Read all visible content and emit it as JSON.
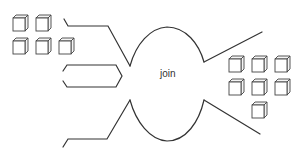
{
  "diagram": {
    "type": "join-illustration",
    "center_label": "join",
    "colors": {
      "stroke": "#333333",
      "background": "#ffffff"
    },
    "inputs": {
      "cube_group_left": {
        "rows": [
          2,
          3
        ],
        "count": 5
      },
      "streams": [
        "top-input-stream",
        "middle-input-stream",
        "bottom-input-stream"
      ]
    },
    "outputs": {
      "cube_group_right": {
        "rows": [
          3,
          3,
          1
        ],
        "count": 7
      },
      "streams": [
        "top-output-stream",
        "bottom-output-stream"
      ]
    }
  }
}
